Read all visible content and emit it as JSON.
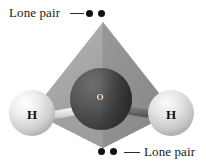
{
  "figure": {
    "background_color": "#ffffff"
  },
  "annotations": {
    "top": {
      "label": "Lone pair",
      "dot_count": 2,
      "leader": "—",
      "position": "top-left"
    },
    "bottom": {
      "label": "Lone pair",
      "dot_count": 2,
      "leader": "—",
      "position": "bottom-right"
    },
    "dot_color": "#111111",
    "text_color": "#1a1a1a"
  },
  "molecule": {
    "name": "water",
    "atoms": [
      {
        "symbol": "H",
        "name": "hydrogen-left",
        "color": "#d8d8d8"
      },
      {
        "symbol": "O",
        "name": "oxygen-center",
        "color": "#4a4a4a"
      },
      {
        "symbol": "H",
        "name": "hydrogen-right",
        "color": "#d8d8d8"
      }
    ],
    "bonds": [
      {
        "name": "bond-o-h-left",
        "color": "#e2e2e2"
      },
      {
        "name": "bond-o-h-right",
        "color": "#6e6e6e"
      }
    ]
  },
  "geometry": {
    "shape": "tetrahedron",
    "face_light_color": "#a9a9a9",
    "face_dark_color": "#8c8c8c",
    "face_base_color": "#b4b4b4"
  }
}
